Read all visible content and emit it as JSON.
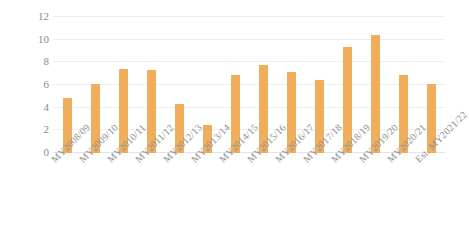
{
  "chart_data": {
    "type": "bar",
    "title": "",
    "subtitle": "",
    "xlabel": "",
    "ylabel": "Ten Thousand MT",
    "ylim": [
      0,
      12
    ],
    "yticks": [
      0,
      2,
      4,
      6,
      8,
      10,
      12
    ],
    "grid": true,
    "legend": false,
    "legend_position": "none",
    "bar_color": "#f0ad5c",
    "gridline_color": "#eceff1",
    "background_color": "#ffffff",
    "categories": [
      "MY2008/09",
      "MY2009/10",
      "MY2010/11",
      "MY2011/12",
      "MY2012/13",
      "MY2013/14",
      "MY2014/15",
      "MY2015/16",
      "MY2016/17",
      "MY2017/18",
      "MY2018/19",
      "MY2019/20",
      "MY2020/21",
      "Est. MY2021/22"
    ],
    "values": [
      4.85,
      6.1,
      7.4,
      7.35,
      4.3,
      2.5,
      6.85,
      7.75,
      7.15,
      6.4,
      9.35,
      10.45,
      6.9,
      6.1
    ]
  }
}
